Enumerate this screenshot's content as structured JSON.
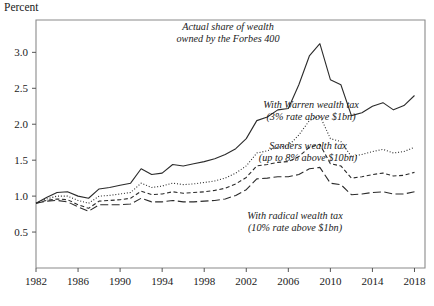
{
  "axis": {
    "unit_label": "Percent",
    "y_ticks": [
      "0.5",
      "1.0",
      "1.5",
      "2.0",
      "2.5",
      "3.0"
    ],
    "x_ticks": [
      "1982",
      "1986",
      "1990",
      "1994",
      "1998",
      "2002",
      "2006",
      "2010",
      "2014",
      "2018"
    ]
  },
  "annotations": [
    {
      "name": "annotation-actual",
      "line1": "Actual share of wealth",
      "line2": "owned by the Forbes 400",
      "x": 228,
      "y": 30
    },
    {
      "name": "annotation-warren",
      "line1": "With Warren wealth tax",
      "line2": "(3% rate above $1bn)",
      "x": 311,
      "y": 108
    },
    {
      "name": "annotation-sanders",
      "line1": "Sanders wealth tax",
      "line2": "(up to 8% above $10bn)",
      "x": 308,
      "y": 149
    },
    {
      "name": "annotation-radical",
      "line1": "With radical wealth tax",
      "line2": "(10% rate above $1bn)",
      "x": 295,
      "y": 219
    }
  ],
  "chart_data": {
    "type": "line",
    "title": "",
    "xlabel": "",
    "ylabel": "Percent",
    "xlim": [
      1982,
      2019
    ],
    "ylim": [
      0.0,
      3.45
    ],
    "grid": false,
    "legend": "inline annotations",
    "x": [
      1982,
      1983,
      1984,
      1985,
      1986,
      1987,
      1988,
      1989,
      1990,
      1991,
      1992,
      1993,
      1994,
      1995,
      1996,
      1997,
      1998,
      1999,
      2000,
      2001,
      2002,
      2003,
      2004,
      2005,
      2006,
      2007,
      2008,
      2009,
      2010,
      2011,
      2012,
      2013,
      2014,
      2015,
      2016,
      2017,
      2018
    ],
    "series": [
      {
        "name": "Actual share of wealth owned by the Forbes 400",
        "style": "solid",
        "color": "#2b2b2b",
        "values": [
          0.9,
          0.98,
          1.05,
          1.06,
          1.0,
          0.97,
          1.1,
          1.12,
          1.15,
          1.18,
          1.38,
          1.3,
          1.32,
          1.44,
          1.42,
          1.45,
          1.48,
          1.52,
          1.58,
          1.66,
          1.8,
          2.05,
          2.1,
          2.2,
          2.22,
          2.55,
          2.95,
          3.12,
          2.62,
          2.55,
          2.12,
          2.16,
          2.25,
          2.3,
          2.2,
          2.26,
          2.4
        ]
      },
      {
        "name": "With Warren wealth tax (3% rate above $1bn)",
        "style": "dotted",
        "color": "#2b2b2b",
        "values": [
          0.9,
          0.96,
          1.0,
          1.0,
          0.94,
          0.9,
          1.0,
          1.01,
          1.03,
          1.05,
          1.18,
          1.12,
          1.14,
          1.18,
          1.16,
          1.17,
          1.19,
          1.21,
          1.25,
          1.32,
          1.42,
          1.6,
          1.63,
          1.68,
          1.7,
          1.85,
          2.05,
          2.12,
          1.8,
          1.76,
          1.55,
          1.58,
          1.62,
          1.65,
          1.6,
          1.62,
          1.68
        ]
      },
      {
        "name": "Sanders wealth tax (up to 8% above $10bn)",
        "style": "short-dash",
        "color": "#2b2b2b",
        "values": [
          0.9,
          0.94,
          0.96,
          0.95,
          0.88,
          0.83,
          0.93,
          0.94,
          0.95,
          0.97,
          1.07,
          1.02,
          1.03,
          1.06,
          1.04,
          1.05,
          1.06,
          1.08,
          1.11,
          1.17,
          1.26,
          1.42,
          1.44,
          1.47,
          1.48,
          1.55,
          1.68,
          1.72,
          1.45,
          1.42,
          1.25,
          1.27,
          1.3,
          1.32,
          1.28,
          1.29,
          1.33
        ]
      },
      {
        "name": "With radical wealth tax (10% rate above $1bn)",
        "style": "long-dash",
        "color": "#2b2b2b",
        "values": [
          0.9,
          0.93,
          0.94,
          0.92,
          0.85,
          0.79,
          0.88,
          0.88,
          0.88,
          0.89,
          0.97,
          0.92,
          0.92,
          0.94,
          0.92,
          0.92,
          0.93,
          0.94,
          0.96,
          1.01,
          1.09,
          1.24,
          1.25,
          1.27,
          1.27,
          1.3,
          1.38,
          1.4,
          1.18,
          1.16,
          1.02,
          1.03,
          1.05,
          1.06,
          1.03,
          1.03,
          1.06
        ]
      }
    ]
  }
}
